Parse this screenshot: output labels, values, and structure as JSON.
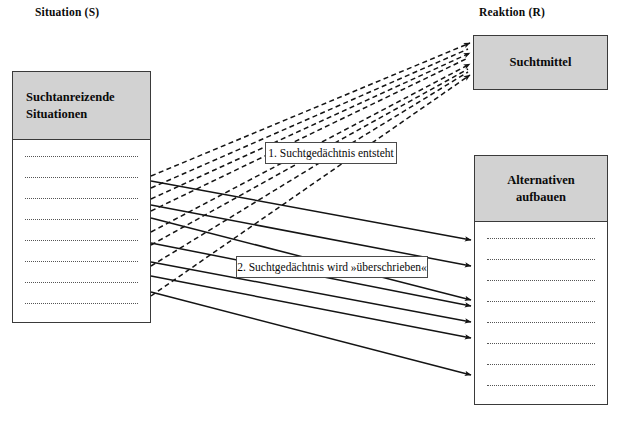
{
  "diagram": {
    "titles": {
      "situation": "Situation (S)",
      "reaktion": "Reaktion (R)"
    },
    "panels": {
      "situation": {
        "header_line1": "Suchtanreizende",
        "header_line2": "Situationen",
        "line_count": 8,
        "fill": "#d2d2d2"
      },
      "suchtmittel": {
        "label": "Suchtmittel",
        "fill": "#d2d2d2"
      },
      "alternativen": {
        "header_line1": "Alternativen",
        "header_line2": "aufbauen",
        "line_count": 8,
        "fill": "#d2d2d2"
      }
    },
    "callouts": {
      "first": "1. Suchtgedächtnis entsteht",
      "second": "2. Suchtgedächtnis wird »überschrieben«"
    },
    "arrows": {
      "dashed_to_suchtmittel_count": 4,
      "solid_to_alternativen_count": 7,
      "stroke": "#1a1a1a"
    }
  }
}
